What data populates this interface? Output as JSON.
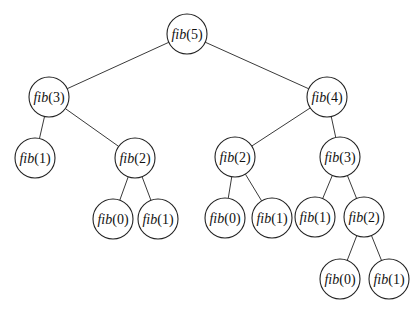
{
  "diagram": {
    "radius": 20,
    "colors": {
      "edge": "#3a3a3a",
      "node_stroke": "#222222",
      "node_fill": "#ffffff",
      "text": "#111111"
    },
    "nodes": [
      {
        "id": "n0",
        "fn": "fib",
        "arg": "5",
        "x": 187,
        "y": 34
      },
      {
        "id": "n1",
        "fn": "fib",
        "arg": "3",
        "x": 49,
        "y": 97
      },
      {
        "id": "n2",
        "fn": "fib",
        "arg": "4",
        "x": 327,
        "y": 97
      },
      {
        "id": "n3",
        "fn": "fib",
        "arg": "1",
        "x": 35,
        "y": 158
      },
      {
        "id": "n4",
        "fn": "fib",
        "arg": "2",
        "x": 135,
        "y": 158
      },
      {
        "id": "n5",
        "fn": "fib",
        "arg": "2",
        "x": 235,
        "y": 157
      },
      {
        "id": "n6",
        "fn": "fib",
        "arg": "3",
        "x": 340,
        "y": 157
      },
      {
        "id": "n7",
        "fn": "fib",
        "arg": "0",
        "x": 113,
        "y": 219
      },
      {
        "id": "n8",
        "fn": "fib",
        "arg": "1",
        "x": 158,
        "y": 219
      },
      {
        "id": "n9",
        "fn": "fib",
        "arg": "0",
        "x": 225,
        "y": 218
      },
      {
        "id": "n10",
        "fn": "fib",
        "arg": "1",
        "x": 272,
        "y": 218
      },
      {
        "id": "n11",
        "fn": "fib",
        "arg": "1",
        "x": 315,
        "y": 217
      },
      {
        "id": "n12",
        "fn": "fib",
        "arg": "2",
        "x": 364,
        "y": 217
      },
      {
        "id": "n13",
        "fn": "fib",
        "arg": "0",
        "x": 340,
        "y": 279
      },
      {
        "id": "n14",
        "fn": "fib",
        "arg": "1",
        "x": 389,
        "y": 279
      }
    ],
    "edges": [
      [
        "n0",
        "n1"
      ],
      [
        "n0",
        "n2"
      ],
      [
        "n1",
        "n3"
      ],
      [
        "n1",
        "n4"
      ],
      [
        "n2",
        "n5"
      ],
      [
        "n2",
        "n6"
      ],
      [
        "n4",
        "n7"
      ],
      [
        "n4",
        "n8"
      ],
      [
        "n5",
        "n9"
      ],
      [
        "n5",
        "n10"
      ],
      [
        "n6",
        "n11"
      ],
      [
        "n6",
        "n12"
      ],
      [
        "n12",
        "n13"
      ],
      [
        "n12",
        "n14"
      ]
    ]
  }
}
